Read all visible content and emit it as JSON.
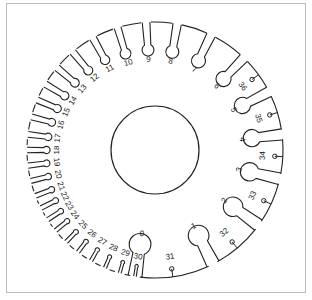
{
  "diagram": {
    "type": "wire-gauge-disc",
    "center_hole": {
      "cx": 155,
      "cy": 150,
      "r": 44
    },
    "outer_radius": 128,
    "large_slots": [
      {
        "label": "0",
        "angle": 189
      },
      {
        "label": "1",
        "angle": 153
      },
      {
        "label": "2",
        "angle": 126
      },
      {
        "label": "3",
        "angle": 103
      },
      {
        "label": "4",
        "angle": 83
      },
      {
        "label": "5",
        "angle": 63
      },
      {
        "label": "6",
        "angle": 44
      },
      {
        "label": "7",
        "angle": 26
      },
      {
        "label": "8",
        "angle": 10
      },
      {
        "label": "9",
        "angle": -4
      },
      {
        "label": "10",
        "angle": -17
      },
      {
        "label": "11",
        "angle": -29
      },
      {
        "label": "12",
        "angle": -40
      },
      {
        "label": "13",
        "angle": -50
      },
      {
        "label": "14",
        "angle": -59
      },
      {
        "label": "15",
        "angle": -67
      },
      {
        "label": "16",
        "angle": -75
      },
      {
        "label": "17",
        "angle": -83
      },
      {
        "label": "18",
        "angle": -90
      },
      {
        "label": "19",
        "angle": -97
      },
      {
        "label": "20",
        "angle": -104
      },
      {
        "label": "21",
        "angle": -111
      },
      {
        "label": "22",
        "angle": -117
      },
      {
        "label": "23",
        "angle": -123
      },
      {
        "label": "24",
        "angle": -129
      },
      {
        "label": "25",
        "angle": -136
      },
      {
        "label": "26",
        "angle": -143
      },
      {
        "label": "27",
        "angle": -150
      },
      {
        "label": "28",
        "angle": -157
      },
      {
        "label": "29",
        "angle": -164
      },
      {
        "label": "30",
        "angle": -171
      }
    ],
    "small_holes": [
      {
        "label": "31",
        "angle": 172
      },
      {
        "label": "32",
        "angle": 140
      },
      {
        "label": "33",
        "angle": 115
      },
      {
        "label": "34",
        "angle": 93
      },
      {
        "label": "35",
        "angle": 73
      },
      {
        "label": "36",
        "angle": 54
      }
    ]
  }
}
